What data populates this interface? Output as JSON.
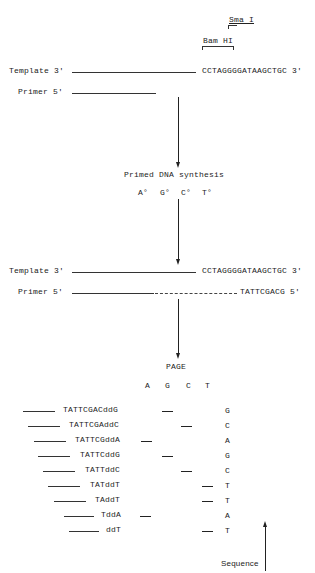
{
  "restriction_sites": {
    "sma": "Sma I",
    "bam": "Bam HI"
  },
  "step1": {
    "template_label": "Template 3'",
    "template_seq": "CCTAGGGGATAAGCTGC 3'",
    "primer_label": "Primer 5'"
  },
  "synthesis": {
    "title": "Primed DNA synthesis",
    "nucleotides": [
      "A°",
      "G°",
      "C°",
      "T°"
    ]
  },
  "step2": {
    "template_label": "Template 3'",
    "template_seq": "CCTAGGGGATAAGCTGC 3'",
    "primer_label": "Primer 5'",
    "extension_seq": "TATTCGACG 5'"
  },
  "page": {
    "title": "PAGE",
    "lanes": [
      "A",
      "G",
      "C",
      "T"
    ]
  },
  "fragments": [
    {
      "seq": "TATTCGACddG",
      "lane": "G",
      "read": "G"
    },
    {
      "seq": "TATTCGAddC",
      "lane": "C",
      "read": "C"
    },
    {
      "seq": "TATTCGddA",
      "lane": "A",
      "read": "A"
    },
    {
      "seq": "TATTCddG",
      "lane": "G",
      "read": "G"
    },
    {
      "seq": "TATTddC",
      "lane": "C",
      "read": "C"
    },
    {
      "seq": "TATddT",
      "lane": "T",
      "read": "T"
    },
    {
      "seq": "TAddT",
      "lane": "T",
      "read": "T"
    },
    {
      "seq": "TddA",
      "lane": "A",
      "read": "A"
    },
    {
      "seq": "ddT",
      "lane": "T",
      "read": "T"
    }
  ],
  "sequence_label": "Sequence"
}
